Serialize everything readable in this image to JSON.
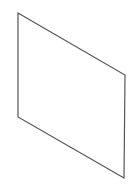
{
  "diagram": {
    "background": "#ffffff",
    "shape": {
      "type": "parallelogram",
      "description": "isometric plane outline",
      "stroke": "#555555",
      "stroke_width": 1.2,
      "fill": "none",
      "points": [
        [
          18,
          13
        ],
        [
          125,
          75
        ],
        [
          124,
          178
        ],
        [
          18,
          117
        ]
      ]
    }
  }
}
